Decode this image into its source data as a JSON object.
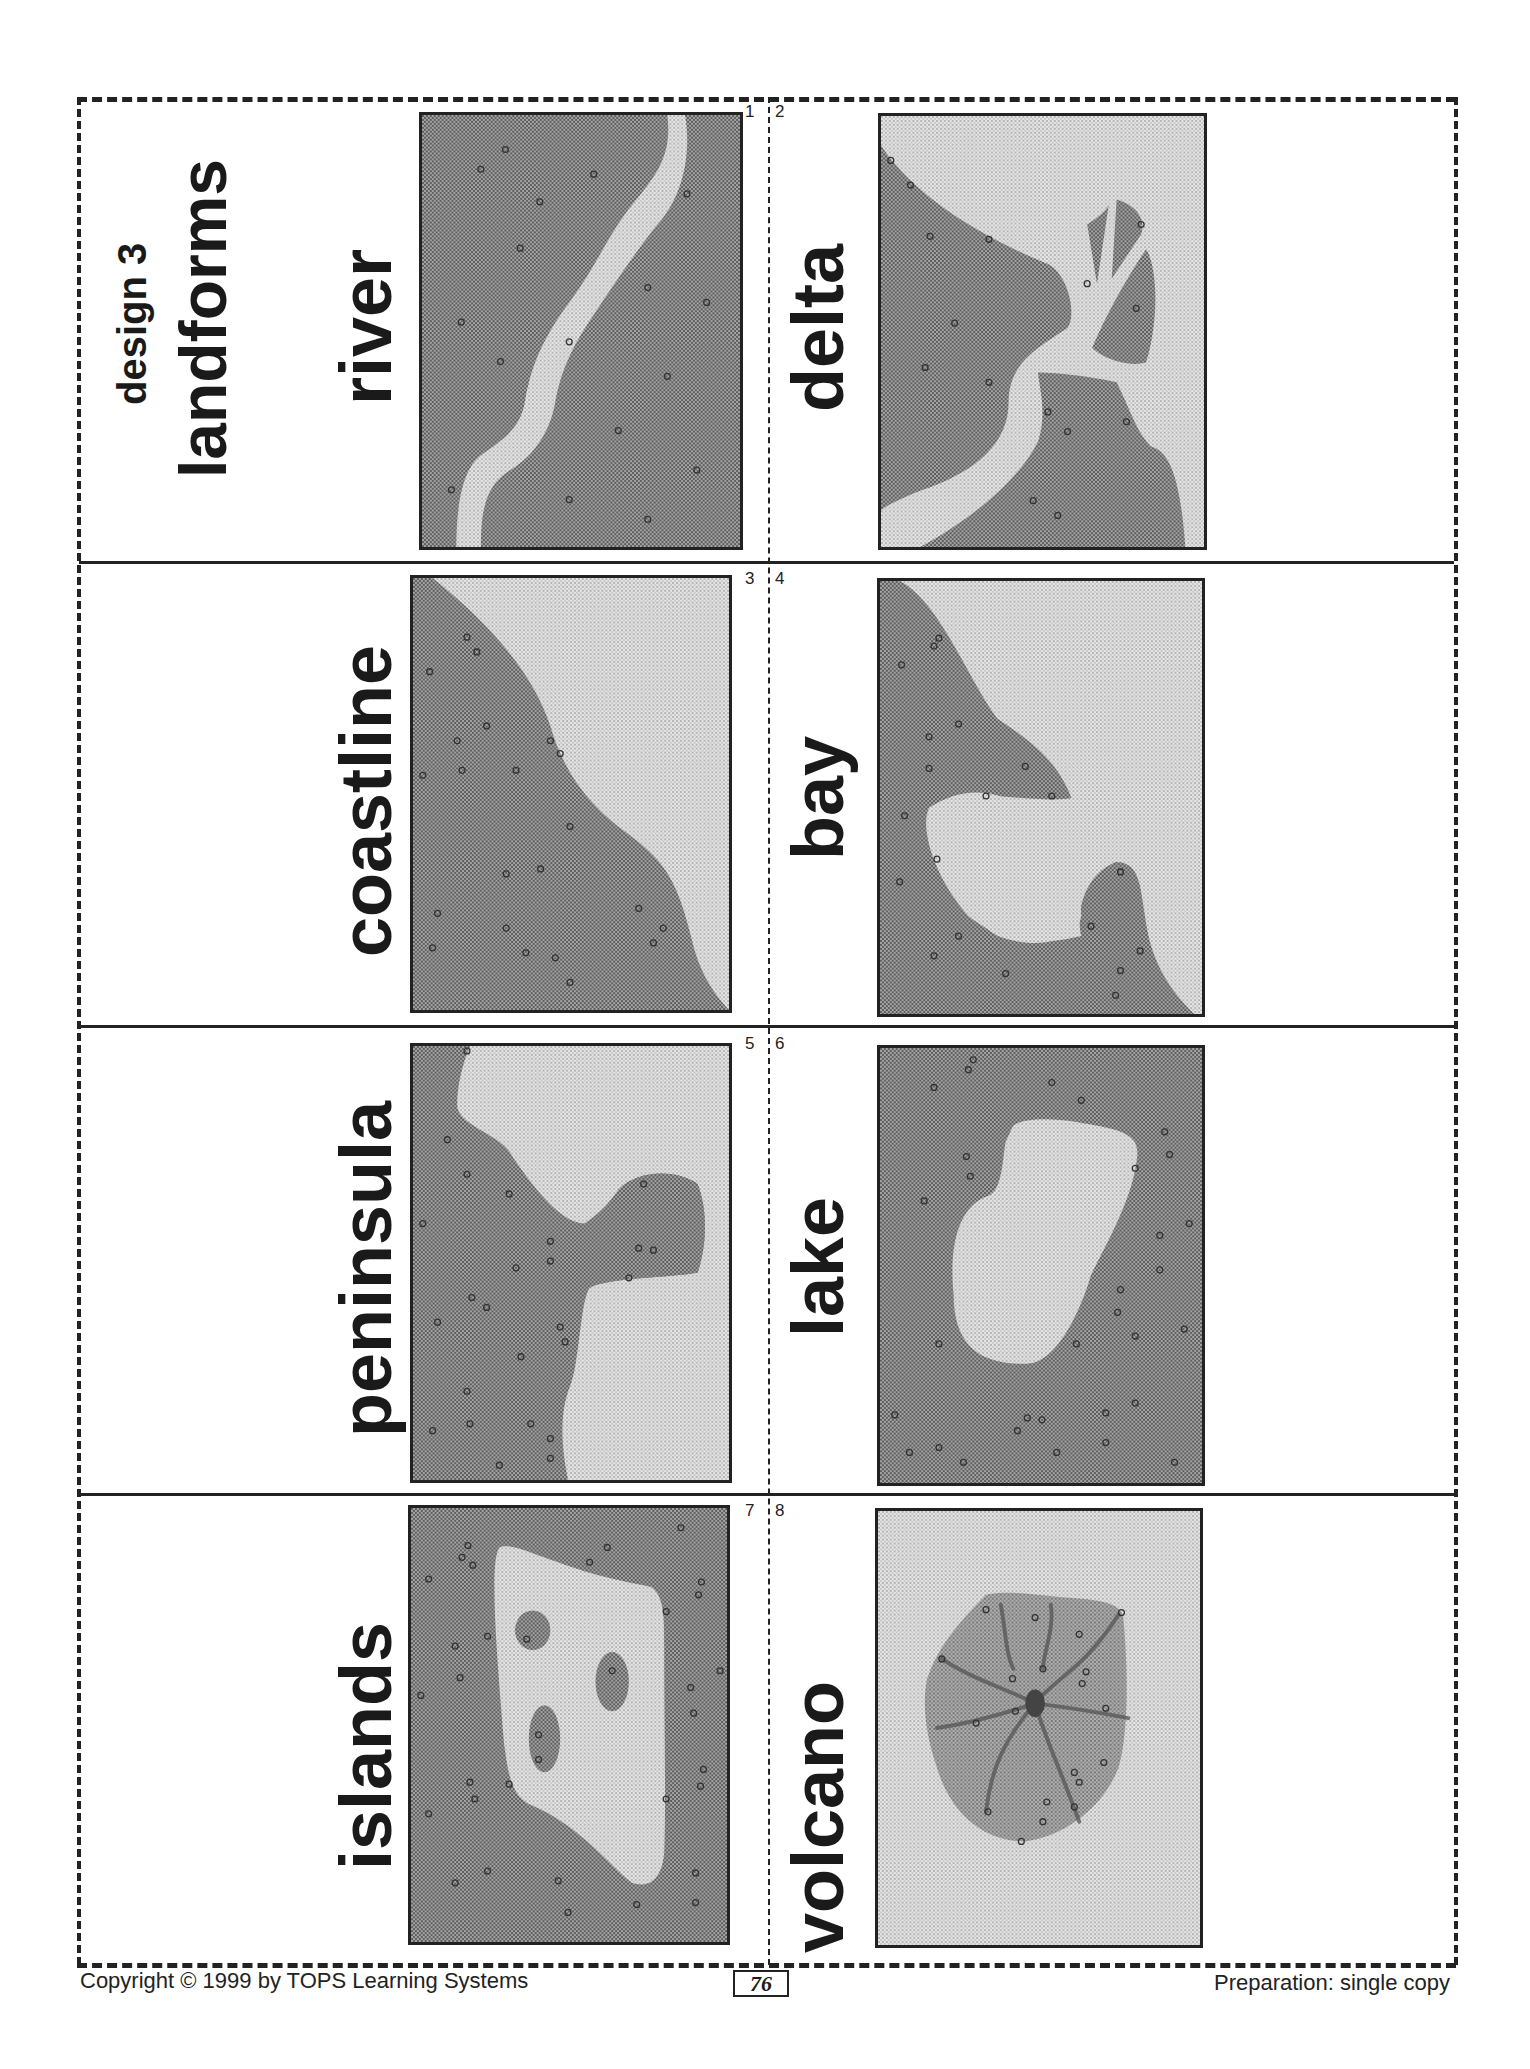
{
  "header": {
    "design": "design 3",
    "title": "landforms"
  },
  "cards": [
    {
      "number": "1",
      "label": "river"
    },
    {
      "number": "2",
      "label": "delta"
    },
    {
      "number": "3",
      "label": "coastline"
    },
    {
      "number": "4",
      "label": "bay"
    },
    {
      "number": "5",
      "label": "peninsula"
    },
    {
      "number": "6",
      "label": "lake"
    },
    {
      "number": "7",
      "label": "islands"
    },
    {
      "number": "8",
      "label": "volcano"
    }
  ],
  "footer": {
    "copyright": "Copyright © 1999 by TOPS Learning Systems",
    "page_number": "76",
    "preparation": "Preparation: single copy"
  },
  "colors": {
    "land": "#8e8e8e",
    "water": "#d2d2d2",
    "ink": "#1a1a1a"
  }
}
